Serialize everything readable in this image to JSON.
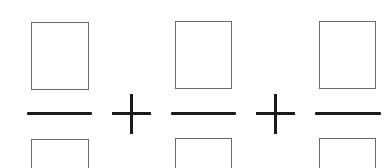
{
  "expression": {
    "description": "Sum of three fractions with empty numerator and denominator boxes",
    "fractions": [
      {
        "numerator": "",
        "denominator": ""
      },
      {
        "numerator": "",
        "denominator": ""
      },
      {
        "numerator": "",
        "denominator": ""
      }
    ],
    "operators": [
      "+",
      "+"
    ]
  },
  "colors": {
    "box_border": "#6b6b6b",
    "line": "#1a1a1a",
    "background": "#ffffff"
  }
}
